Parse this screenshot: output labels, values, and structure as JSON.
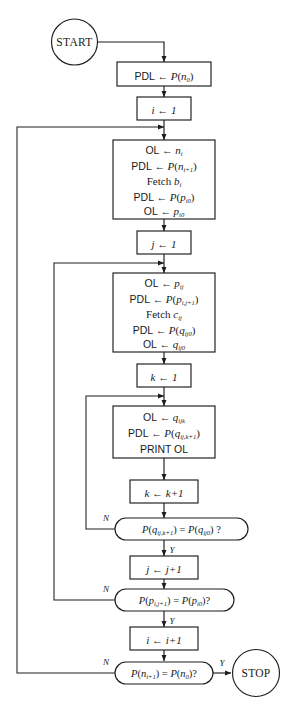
{
  "diagram": {
    "terminals": {
      "start": "START",
      "stop": "STOP"
    },
    "branch_labels": {
      "yes": "Y",
      "no": "N"
    },
    "nodes": {
      "init_pdl": {
        "kind": "process",
        "lines": [
          {
            "left": "PDL",
            "arrow": "←",
            "right": "P(n",
            "sub": "0",
            "tail": ")"
          }
        ],
        "text": "PDL ← P(n0)"
      },
      "i_init": {
        "kind": "process",
        "text": "i ← 1",
        "var": "i",
        "arrow": "←",
        "value": "1"
      },
      "block_i": {
        "kind": "process",
        "text": "OL ← ni ; PDL ← P(ni+1) ; Fetch bi ; PDL ← P(pi0) ; OL ← pi0",
        "rows": [
          {
            "lhs": "OL",
            "arrow": "←",
            "base": "n",
            "sub": "i"
          },
          {
            "lhs": "PDL",
            "arrow": "←",
            "fn": "P(n",
            "sub": "i+1",
            "tail": ")"
          },
          {
            "lhs": "Fetch",
            "base": "b",
            "sub": "i"
          },
          {
            "lhs": "PDL",
            "arrow": "←",
            "fn": "P(p",
            "sub": "i0",
            "tail": ")"
          },
          {
            "lhs": "OL",
            "arrow": "←",
            "base": "p",
            "sub": "i0"
          }
        ]
      },
      "j_init": {
        "kind": "process",
        "text": "j ← 1",
        "var": "j",
        "arrow": "←",
        "value": "1"
      },
      "block_j": {
        "kind": "process",
        "text": "OL ← pij ; PDL ← P(pi,j+1) ; Fetch cij ; PDL ← P(qij0) ; OL ← qij0",
        "rows": [
          {
            "lhs": "OL",
            "arrow": "←",
            "base": "p",
            "sub": "ij"
          },
          {
            "lhs": "PDL",
            "arrow": "←",
            "fn": "P(p",
            "sub": "i,j+1",
            "tail": ")"
          },
          {
            "lhs": "Fetch",
            "base": "c",
            "sub": "ij"
          },
          {
            "lhs": "PDL",
            "arrow": "←",
            "fn": "P(q",
            "sub": "ij0",
            "tail": ")"
          },
          {
            "lhs": "OL",
            "arrow": "←",
            "base": "q",
            "sub": "ij0"
          }
        ]
      },
      "k_init": {
        "kind": "process",
        "text": "k ← 1",
        "var": "k",
        "arrow": "←",
        "value": "1"
      },
      "block_k": {
        "kind": "process",
        "text": "OL ← qijk ; PDL ← P(qij,k+1) ; PRINT OL",
        "rows": [
          {
            "lhs": "OL",
            "arrow": "←",
            "base": "q",
            "sub": "ijk"
          },
          {
            "lhs": "PDL",
            "arrow": "←",
            "fn": "P(q",
            "sub": "ij,k+1",
            "tail": ")"
          },
          {
            "lhs": "PRINT OL"
          }
        ],
        "print_label": "PRINT OL"
      },
      "k_incr": {
        "kind": "process",
        "text": "k ← k+1",
        "var": "k",
        "arrow": "←",
        "value": "k+1"
      },
      "decision_k": {
        "kind": "decision",
        "text": "P(qij,k+1) = P(qij0) ?",
        "lhs_fn": "P(q",
        "lhs_sub": "ij,k+1",
        "lhs_tail": ")",
        "eq": "=",
        "rhs_fn": "P(q",
        "rhs_sub": "ij0",
        "rhs_tail": ") ?",
        "yes": "Y",
        "no": "N"
      },
      "j_incr": {
        "kind": "process",
        "text": "j ← j+1",
        "var": "j",
        "arrow": "←",
        "value": "j+1"
      },
      "decision_j": {
        "kind": "decision",
        "text": "P(pi,j+1) = P(pi0)?",
        "lhs_fn": "P(p",
        "lhs_sub": "i,j+1",
        "lhs_tail": ")",
        "eq": "=",
        "rhs_fn": "P(p",
        "rhs_sub": "i0",
        "rhs_tail": ")?",
        "yes": "Y",
        "no": "N"
      },
      "i_incr": {
        "kind": "process",
        "text": "i ← i+1",
        "var": "i",
        "arrow": "←",
        "value": "i+1"
      },
      "decision_i": {
        "kind": "decision",
        "text": "P(ni+1) = P(n0)?",
        "lhs_fn": "P(n",
        "lhs_sub": "i+1",
        "lhs_tail": ")",
        "eq": "=",
        "rhs_fn": "P(n",
        "rhs_sub": "0",
        "rhs_tail": ")?",
        "yes": "Y",
        "no": "N"
      }
    },
    "colors": {
      "ink": "#1d1d1d",
      "paper": "#ffffff"
    }
  }
}
